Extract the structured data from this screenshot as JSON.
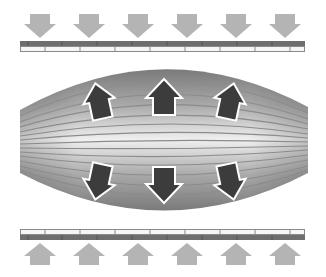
{
  "diagram": {
    "title": "",
    "colors": {
      "background": "#ffffff",
      "external_arrow": "#b4b4b4",
      "internal_arrow_fill": "#3c3c3c",
      "internal_arrow_outline": "#ffffff",
      "plate_dark": "#6e6e6e",
      "plate_light": "#f6f6f6",
      "plate_divider": "#8a8a8a",
      "muscle_edge": "#7a7a7a",
      "muscle_center": "#f0f0f0",
      "muscle_fiber_line": "#8c8c8c"
    },
    "top_plate": {
      "dividers_x": [
        45,
        80,
        115,
        150,
        185,
        220,
        255,
        290
      ]
    },
    "bottom_plate": {
      "dividers_x": [
        45,
        80,
        115,
        150,
        185,
        220,
        255,
        290
      ]
    },
    "external_arrows_top": {
      "direction": "down",
      "count": 6,
      "centers_x": [
        40,
        89,
        138,
        187,
        236,
        285
      ]
    },
    "external_arrows_bottom": {
      "direction": "up",
      "count": 6,
      "centers_x": [
        40,
        89,
        138,
        187,
        236,
        285
      ]
    },
    "internal_arrows": [
      {
        "direction": "up",
        "cx": 99,
        "tilt": -12
      },
      {
        "direction": "up",
        "cx": 164,
        "tilt": 0
      },
      {
        "direction": "up",
        "cx": 230,
        "tilt": 12
      },
      {
        "direction": "down",
        "cx": 99,
        "tilt": 12
      },
      {
        "direction": "down",
        "cx": 164,
        "tilt": 0
      },
      {
        "direction": "down",
        "cx": 230,
        "tilt": -12
      }
    ]
  }
}
